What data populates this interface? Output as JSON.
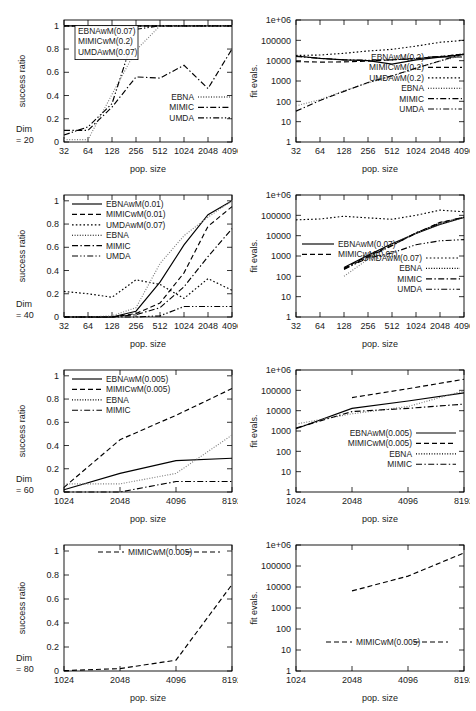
{
  "figure": {
    "axis_labels": {
      "x": "pop. size",
      "y_left": "success ratio",
      "y_right": "fit evals."
    },
    "ratio_ticks": [
      "0",
      "0.2",
      "0.4",
      "0.6",
      "0.8",
      "1"
    ],
    "evals_ticks": [
      "1",
      "10",
      "100",
      "1000",
      "10000",
      "100000",
      "1e+06"
    ],
    "xticks_small": [
      "32",
      "64",
      "128",
      "256",
      "512",
      "1024",
      "2048",
      "4096"
    ],
    "xticks_large": [
      "1024",
      "2048",
      "4096",
      "8192"
    ],
    "dim_labels": {
      "d20": "Dim\n= 20",
      "d20a": "Dim",
      "d20b": "= 20",
      "d40b": "= 40",
      "d60b": "= 60",
      "d80b": "= 80"
    }
  },
  "chart_data": [
    {
      "id": "row1-success",
      "type": "line",
      "title": "",
      "xlabel": "pop. size",
      "ylabel": "success ratio",
      "xscale": "log2",
      "yscale": "linear",
      "xlim": [
        32,
        4096
      ],
      "ylim": [
        0,
        1.05
      ],
      "x": [
        32,
        64,
        128,
        256,
        512,
        1024,
        2048,
        4096
      ],
      "dim_annotation": "Dim = 20",
      "grid": false,
      "legend_position": "inside-top-left-box",
      "boxed_legend": [
        "EBNAwM(0.07)",
        "MIMICwM(0.2)",
        "UMDAwM(0.07)"
      ],
      "series": [
        {
          "name": "EBNAwM(0.07)",
          "style": "solid",
          "values": [
            1,
            1,
            1,
            1,
            1,
            1,
            1,
            1
          ]
        },
        {
          "name": "MIMICwM(0.2)",
          "style": "dash",
          "values": [
            1,
            1,
            1,
            1,
            1,
            1,
            1,
            1
          ]
        },
        {
          "name": "UMDAwM(0.07)",
          "style": "dot",
          "values": [
            1,
            1,
            1,
            1,
            1,
            1,
            1,
            1
          ]
        },
        {
          "name": "EBNA",
          "style": "fine",
          "values": [
            0.02,
            0.02,
            0.41,
            0.79,
            1.0,
            1.0,
            1.0,
            1.0
          ]
        },
        {
          "name": "MIMIC",
          "style": "dashdot",
          "values": [
            0.1,
            0.1,
            0.3,
            0.56,
            0.55,
            0.66,
            0.46,
            0.8
          ]
        },
        {
          "name": "UMDA",
          "style": "dashdotdot",
          "values": [
            0.06,
            0.13,
            0.33,
            0.97,
            1.0,
            1.0,
            1.0,
            1.0
          ]
        }
      ],
      "legend_entries": [
        "EBNA",
        "MIMIC",
        "UMDA"
      ]
    },
    {
      "id": "row1-evals",
      "type": "line",
      "xlabel": "pop. size",
      "ylabel": "fit evals.",
      "xscale": "log2",
      "yscale": "log10",
      "xlim": [
        32,
        4096
      ],
      "ylim": [
        1,
        1000000
      ],
      "x": [
        32,
        64,
        128,
        256,
        512,
        1024,
        2048,
        4096
      ],
      "grid": false,
      "legend_position": "inside-bottom-right",
      "series": [
        {
          "name": "EBNAwM(0.2)",
          "style": "solid",
          "values": [
            17000,
            13000,
            11000,
            10000,
            6800,
            11000,
            15000,
            20000
          ]
        },
        {
          "name": "MIMICwM(0.2)",
          "style": "dash",
          "values": [
            9000,
            8500,
            8700,
            9500,
            11000,
            13000,
            16000,
            21000
          ]
        },
        {
          "name": "UMDAwM(0.2)",
          "style": "dot",
          "values": [
            18000,
            19000,
            23000,
            30000,
            36000,
            52000,
            80000,
            100000
          ]
        },
        {
          "name": "EBNA",
          "style": "fine",
          "values": [
            60,
            120,
            330,
            800,
            1700,
            4200,
            9500,
            19000
          ]
        },
        {
          "name": "MIMIC",
          "style": "dashdot",
          "values": [
            33,
            110,
            310,
            850,
            1800,
            4300,
            9800,
            22000
          ]
        },
        {
          "name": "UMDA",
          "style": "dashdotdot",
          "values": [
            16000,
            13000,
            11000,
            10500,
            11000,
            12500,
            16000,
            21000
          ]
        }
      ],
      "legend_entries": [
        "EBNAwM(0.2)",
        "MIMICwM(0.2)",
        "UMDAwM(0.2)",
        "EBNA",
        "MIMIC",
        "UMDA"
      ]
    },
    {
      "id": "row2-success",
      "type": "line",
      "xlabel": "pop. size",
      "ylabel": "success ratio",
      "xscale": "log2",
      "yscale": "linear",
      "xlim": [
        32,
        4096
      ],
      "ylim": [
        0,
        1.05
      ],
      "x": [
        32,
        64,
        128,
        256,
        512,
        1024,
        2048,
        4096
      ],
      "dim_annotation": "Dim = 40",
      "grid": false,
      "legend_position": "inside-top-left",
      "series": [
        {
          "name": "EBNAwM(0.01)",
          "style": "solid",
          "values": [
            0,
            0,
            0,
            0.05,
            0.3,
            0.62,
            0.88,
            1.0
          ]
        },
        {
          "name": "MIMICwM(0.01)",
          "style": "dash",
          "values": [
            0,
            0,
            0,
            0.03,
            0.12,
            0.38,
            0.78,
            0.95
          ]
        },
        {
          "name": "UMDAwM(0.07)",
          "style": "dot",
          "values": [
            0.22,
            0.2,
            0.17,
            0.32,
            0.28,
            0.16,
            0.33,
            0.23
          ]
        },
        {
          "name": "EBNA",
          "style": "fine",
          "values": [
            0,
            0,
            0.01,
            0.08,
            0.46,
            0.7,
            0.86,
            1.0
          ]
        },
        {
          "name": "MIMIC",
          "style": "dashdot",
          "values": [
            0,
            0,
            0,
            0.02,
            0.08,
            0.26,
            0.52,
            0.76
          ]
        },
        {
          "name": "UMDA",
          "style": "dashdotdot",
          "values": [
            0,
            0,
            0,
            0,
            0.01,
            0.09,
            0.09,
            0.09
          ]
        }
      ],
      "legend_entries": [
        "EBNAwM(0.01)",
        "MIMICwM(0.01)",
        "UMDAwM(0.07)",
        "EBNA",
        "MIMIC",
        "UMDA"
      ]
    },
    {
      "id": "row2-evals",
      "type": "line",
      "xlabel": "pop. size",
      "ylabel": "fit evals.",
      "xscale": "log2",
      "yscale": "log10",
      "xlim": [
        32,
        4096
      ],
      "ylim": [
        1,
        1000000
      ],
      "x": [
        32,
        64,
        128,
        256,
        512,
        1024,
        2048,
        4096
      ],
      "grid": false,
      "legend_position": "split-top-left-and-bottom-right",
      "series": [
        {
          "name": "EBNAwM(0.07)",
          "style": "solid",
          "values": [
            null,
            null,
            270,
            1100,
            4000,
            13000,
            36000,
            78000
          ]
        },
        {
          "name": "MIMICwM(0.07)",
          "style": "dash",
          "values": [
            null,
            null,
            250,
            1000,
            3400,
            13000,
            45000,
            80000
          ]
        },
        {
          "name": "UMDAwM(0.07)",
          "style": "dot",
          "values": [
            60000,
            66000,
            90000,
            75000,
            64000,
            100000,
            180000,
            150000
          ]
        },
        {
          "name": "EBNA",
          "style": "fine",
          "values": [
            null,
            null,
            100,
            700,
            3600,
            13000,
            38000,
            80000
          ]
        },
        {
          "name": "MIMIC",
          "style": "dashdot",
          "values": [
            null,
            null,
            230,
            900,
            3200,
            14000,
            42000,
            82000
          ]
        },
        {
          "name": "UMDA",
          "style": "dashdotdot",
          "values": [
            null,
            null,
            220,
            800,
            1400,
            3600,
            5600,
            6400
          ]
        }
      ],
      "legend_top": [
        "EBNAwM(0.07)",
        "MIMICwM(0.07)"
      ],
      "legend_bottom": [
        "UMDAwM(0.07)",
        "EBNA",
        "MIMIC",
        "UMDA"
      ]
    },
    {
      "id": "row3-success",
      "type": "line",
      "xlabel": "pop. size",
      "ylabel": "success ratio",
      "xscale": "log2",
      "yscale": "linear",
      "xlim": [
        1024,
        8192
      ],
      "ylim": [
        0,
        1.05
      ],
      "x": [
        1024,
        2048,
        4096,
        8192
      ],
      "dim_annotation": "Dim = 60",
      "grid": false,
      "legend_position": "inside-top-left",
      "series": [
        {
          "name": "EBNAwM(0.005)",
          "style": "solid",
          "values": [
            0.02,
            0.16,
            0.27,
            0.29
          ]
        },
        {
          "name": "MIMICwM(0.005)",
          "style": "dash",
          "values": [
            0.04,
            0.45,
            0.66,
            0.89
          ]
        },
        {
          "name": "EBNA",
          "style": "fine",
          "values": [
            0.07,
            0.07,
            0.16,
            0.49
          ]
        },
        {
          "name": "MIMIC",
          "style": "dashdot",
          "values": [
            0.0,
            0.0,
            0.09,
            0.09
          ]
        }
      ],
      "legend_entries": [
        "EBNAwM(0.005)",
        "MIMICwM(0.005)",
        "EBNA",
        "MIMIC"
      ]
    },
    {
      "id": "row3-evals",
      "type": "line",
      "xlabel": "pop. size",
      "ylabel": "fit evals.",
      "xscale": "log2",
      "yscale": "log10",
      "xlim": [
        1024,
        8192
      ],
      "ylim": [
        1,
        1000000
      ],
      "x": [
        1024,
        2048,
        4096,
        8192
      ],
      "grid": false,
      "legend_position": "inside-bottom-center",
      "series": [
        {
          "name": "EBNAwM(0.005)",
          "style": "solid",
          "values": [
            1300,
            13000,
            30000,
            75000
          ]
        },
        {
          "name": "MIMICwM(0.005)",
          "style": "dash",
          "values": [
            null,
            44000,
            120000,
            350000
          ]
        },
        {
          "name": "EBNA",
          "style": "fine",
          "values": [
            2200,
            7000,
            16000,
            95000
          ]
        },
        {
          "name": "MIMIC",
          "style": "dashdot",
          "values": [
            1400,
            9000,
            13000,
            21000
          ]
        }
      ],
      "legend_entries": [
        "EBNAwM(0.005)",
        "MIMICwM(0.005)",
        "EBNA",
        "MIMIC"
      ]
    },
    {
      "id": "row4-success",
      "type": "line",
      "xlabel": "pop. size",
      "ylabel": "success ratio",
      "xscale": "log2",
      "yscale": "linear",
      "xlim": [
        1024,
        8192
      ],
      "ylim": [
        0,
        1.05
      ],
      "x": [
        1024,
        2048,
        4096,
        8192
      ],
      "dim_annotation": "Dim = 80",
      "grid": false,
      "legend_position": "inside-top-center",
      "series": [
        {
          "name": "MIMICwM(0.005)",
          "style": "dash",
          "values": [
            0.003,
            0.02,
            0.09,
            0.72
          ]
        }
      ],
      "legend_entries": [
        "MIMICwM(0.005)"
      ]
    },
    {
      "id": "row4-evals",
      "type": "line",
      "xlabel": "pop. size",
      "ylabel": "fit evals.",
      "xscale": "log2",
      "yscale": "log10",
      "xlim": [
        1024,
        8192
      ],
      "ylim": [
        1,
        1000000
      ],
      "x": [
        1024,
        2048,
        4096,
        8192
      ],
      "grid": false,
      "legend_position": "inside-bottom-center",
      "series": [
        {
          "name": "MIMICwM(0.005)",
          "style": "dash",
          "values": [
            null,
            6500,
            33000,
            420000
          ]
        }
      ],
      "legend_entries": [
        "MIMICwM(0.005)"
      ]
    }
  ]
}
